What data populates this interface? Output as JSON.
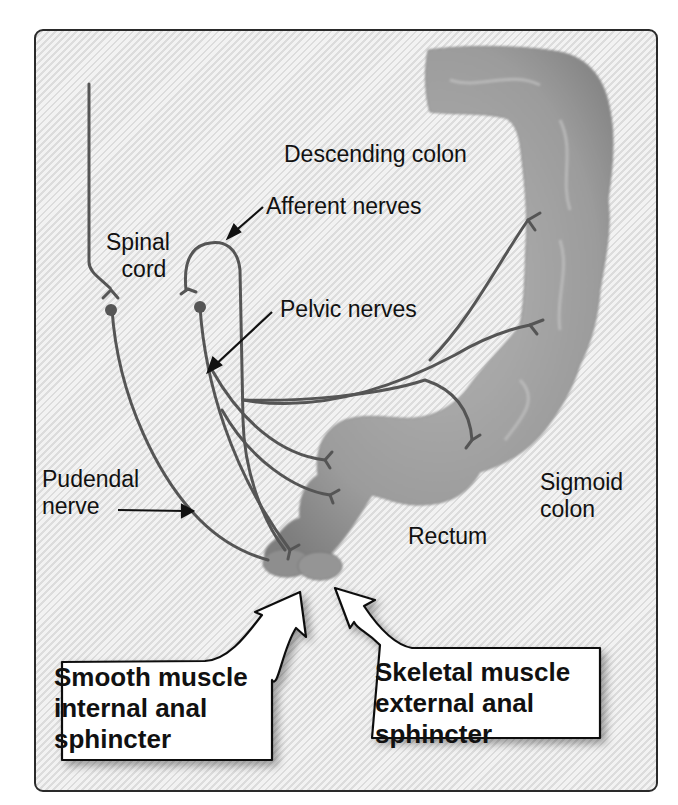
{
  "diagram": {
    "title_region": "Defecation reflex innervation of colon and rectum",
    "labels": {
      "descending_colon": "Descending colon",
      "afferent_nerves": "Afferent nerves",
      "spinal_cord_line1": "Spinal",
      "spinal_cord_line2": "cord",
      "pelvic_nerves": "Pelvic nerves",
      "pudendal_nerve_line1": "Pudendal",
      "pudendal_nerve_line2": "nerve",
      "sigmoid_colon_line1": "Sigmoid",
      "sigmoid_colon_line2": "colon",
      "rectum": "Rectum"
    },
    "callouts": [
      {
        "lines": [
          "Smooth muscle",
          "internal anal",
          "sphincter"
        ]
      },
      {
        "lines": [
          "Skeletal muscle",
          "external anal",
          "sphincter"
        ]
      }
    ],
    "colors": {
      "background_stripe_light": "#f2f2f2",
      "background_stripe_dark": "#dcdcdc",
      "frame_border": "#2a2a2a",
      "colon_fill": "#9a9a9a",
      "nerve_stroke": "#555555",
      "text": "#111111"
    }
  }
}
